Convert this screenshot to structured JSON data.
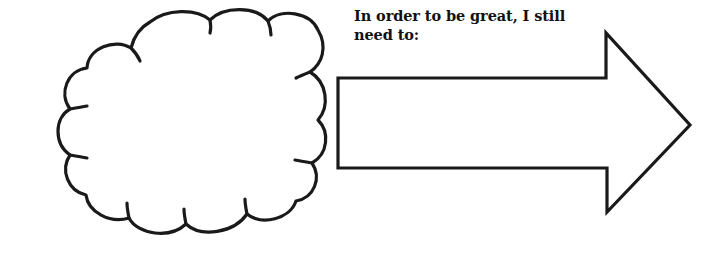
{
  "page": {
    "type": "worksheet-graphic",
    "background_color": "#ffffff",
    "ink_color": "#1a1a1a",
    "width": 721,
    "height": 253
  },
  "prompt": {
    "text": "In order to be great, I still\nneed to:",
    "line_1": "In order to be great, I still",
    "line_2": "need to:",
    "color": "#111111"
  },
  "shapes": {
    "thought_cloud": {
      "name": "thought-cloud",
      "label": "",
      "stroke_color": "#1a1a1a",
      "fill_color": "#ffffff"
    },
    "arrow": {
      "name": "right-arrow",
      "label": "",
      "direction": "right",
      "stroke_color": "#1a1a1a",
      "fill_color": "#ffffff"
    }
  }
}
